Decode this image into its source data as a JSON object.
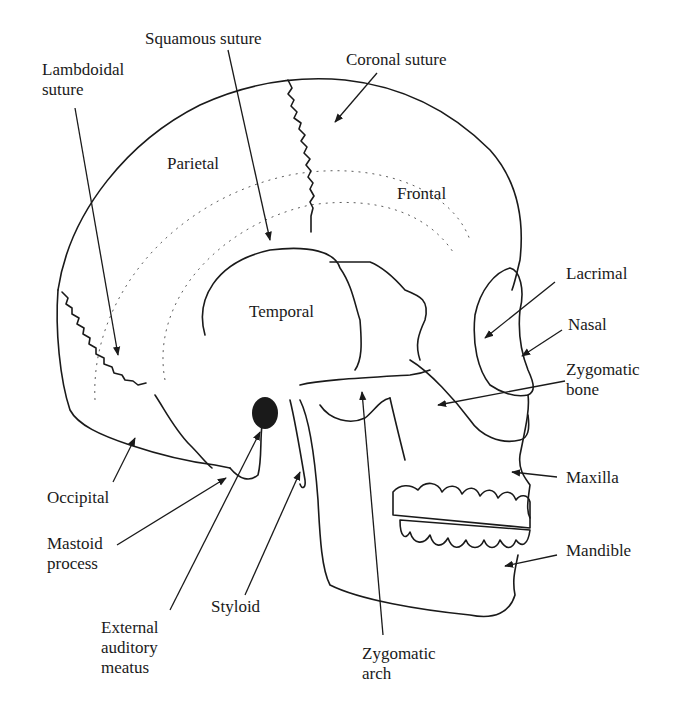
{
  "labels": {
    "squamous_suture": "Squamous suture",
    "lambdoidal_suture": [
      "Lambdoidal",
      "suture"
    ],
    "coronal_suture": "Coronal suture",
    "lacrimal": "Lacrimal",
    "nasal": "Nasal",
    "zygomatic_bone": [
      "Zygomatic",
      "bone"
    ],
    "maxilla": "Maxilla",
    "mandible": "Mandible",
    "occipital": "Occipital",
    "mastoid_process": [
      "Mastoid",
      "process"
    ],
    "styloid": "Styloid",
    "external_auditory_meatus": [
      "External",
      "auditory",
      "meatus"
    ],
    "zygomatic_arch": [
      "Zygomatic",
      "arch"
    ]
  },
  "regions": {
    "parietal": "Parietal",
    "frontal": "Frontal",
    "temporal": "Temporal"
  },
  "colors": {
    "ink": "#1a1a1a",
    "background": "#ffffff"
  }
}
